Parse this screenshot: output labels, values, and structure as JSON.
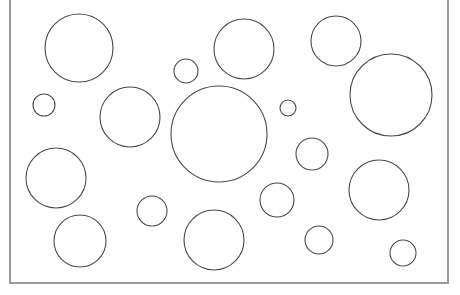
{
  "canvas": {
    "width": 460,
    "height": 295,
    "background": "#ffffff"
  },
  "frame": {
    "left": 10,
    "right": 448,
    "bottom": 283,
    "top_open": true,
    "stroke": "#9a9a9a",
    "stroke_width": 2
  },
  "circle_style": {
    "stroke": "#4a4a4a",
    "stroke_width": 1.1,
    "fill": "none"
  },
  "circles": [
    {
      "cx": 79,
      "cy": 48,
      "r": 34
    },
    {
      "cx": 244,
      "cy": 49,
      "r": 30
    },
    {
      "cx": 336,
      "cy": 41,
      "r": 25
    },
    {
      "cx": 186,
      "cy": 71,
      "r": 12
    },
    {
      "cx": 391,
      "cy": 95,
      "r": 41
    },
    {
      "cx": 44,
      "cy": 105,
      "r": 11
    },
    {
      "cx": 130,
      "cy": 117,
      "r": 30
    },
    {
      "cx": 219,
      "cy": 134,
      "r": 48
    },
    {
      "cx": 288,
      "cy": 108,
      "r": 8
    },
    {
      "cx": 312,
      "cy": 154,
      "r": 16
    },
    {
      "cx": 56,
      "cy": 178,
      "r": 30
    },
    {
      "cx": 379,
      "cy": 190,
      "r": 30
    },
    {
      "cx": 277,
      "cy": 200,
      "r": 17
    },
    {
      "cx": 152,
      "cy": 211,
      "r": 15
    },
    {
      "cx": 80,
      "cy": 241,
      "r": 26
    },
    {
      "cx": 214,
      "cy": 240,
      "r": 30
    },
    {
      "cx": 319,
      "cy": 240,
      "r": 14
    },
    {
      "cx": 403,
      "cy": 253,
      "r": 13
    }
  ]
}
